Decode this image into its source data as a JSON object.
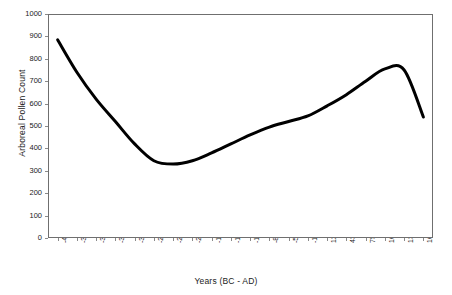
{
  "chart_data": {
    "type": "line",
    "title": "",
    "xlabel": "Years (BC - AD)",
    "ylabel": "Arboreal Pollen Count",
    "ylim": [
      0,
      1000
    ],
    "ytick_step": 100,
    "yticks": [
      1000,
      900,
      800,
      700,
      600,
      500,
      400,
      300,
      200,
      100,
      0
    ],
    "grid": false,
    "legend": false,
    "legend_position": "none",
    "line_color": "#000000",
    "line_width_px": 3,
    "background_color": "#ffffff",
    "frame_color": "#6f6f6f",
    "categories": [
      "-4250",
      "-3937",
      "-3625",
      "-3312",
      "-3000",
      "-2687",
      "-2375",
      "-2062",
      "-1750",
      "-1437",
      "-1125",
      "-812",
      "-500",
      "-187",
      "125",
      "438",
      "750",
      "1063",
      "1375",
      "1688"
    ],
    "x": [
      -4250,
      -3937,
      -3625,
      -3312,
      -3000,
      -2687,
      -2375,
      -2062,
      -1750,
      -1437,
      -1125,
      -812,
      -500,
      -187,
      125,
      438,
      750,
      1063,
      1375,
      1688
    ],
    "values": [
      885,
      740,
      620,
      520,
      420,
      345,
      330,
      345,
      380,
      420,
      460,
      495,
      520,
      545,
      590,
      640,
      700,
      755,
      750,
      540
    ],
    "series": [
      {
        "name": "Arboreal Pollen Count",
        "values": [
          885,
          740,
          620,
          520,
          420,
          345,
          330,
          345,
          380,
          420,
          460,
          495,
          520,
          545,
          590,
          640,
          700,
          755,
          750,
          540
        ]
      }
    ],
    "annotations": []
  }
}
